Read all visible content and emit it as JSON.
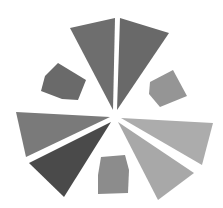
{
  "artwork": {
    "width": 223,
    "height": 208,
    "background": "#ffffff",
    "center": [
      115,
      115
    ],
    "wedges": [
      {
        "name": "top-left-wedge",
        "points": "70,28 115,18 113,110",
        "color": "#6e6e6e"
      },
      {
        "name": "top-right-wedge",
        "points": "120,18 169,33 117,110",
        "color": "#696969"
      },
      {
        "name": "left-wedge",
        "points": "16,112 110,117 26,157",
        "color": "#7a7a7a"
      },
      {
        "name": "lower-left-wedge",
        "points": "29,163 111,122 64,197",
        "color": "#4a4a4a"
      },
      {
        "name": "right-wedge",
        "points": "121,118 213,123 202,165",
        "color": "#acacac"
      },
      {
        "name": "lower-right-wedge",
        "points": "118,122 194,173 158,200",
        "color": "#a8a8a8"
      }
    ],
    "polygons": [
      {
        "name": "upper-left-polygon",
        "points": "58,63 86,80 78,100 62,99 41,91 45,76",
        "color": "#6a6a6a"
      },
      {
        "name": "upper-right-polygon",
        "points": "150,82 173,70 187,96 160,107 149,94",
        "color": "#959595"
      },
      {
        "name": "bottom-polygon",
        "points": "101,157 125,155 129,170 128,193 98,194 98,175",
        "color": "#8c8c8c"
      }
    ]
  }
}
